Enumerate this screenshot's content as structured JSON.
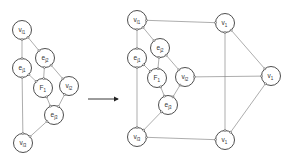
{
  "diagram": {
    "left": {
      "nodes": [
        {
          "id": "vl1",
          "main": "v",
          "sub": "l1",
          "x": 22,
          "y": 30
        },
        {
          "id": "ej2",
          "main": "e",
          "sub": "j2",
          "x": 45,
          "y": 58
        },
        {
          "id": "ej1",
          "main": "e",
          "sub": "j1",
          "x": 22,
          "y": 68
        },
        {
          "id": "F1",
          "main": "F",
          "sub": "1",
          "x": 43,
          "y": 88
        },
        {
          "id": "vl2",
          "main": "v",
          "sub": "l2",
          "x": 69,
          "y": 86
        },
        {
          "id": "ej3",
          "main": "e",
          "sub": "j3",
          "x": 54,
          "y": 115
        },
        {
          "id": "vl3",
          "main": "v",
          "sub": "l3",
          "x": 23,
          "y": 143
        }
      ],
      "edges": [
        [
          "vl1",
          "ej1"
        ],
        [
          "vl1",
          "ej2"
        ],
        [
          "ej1",
          "F1"
        ],
        [
          "ej2",
          "F1"
        ],
        [
          "ej2",
          "vl2"
        ],
        [
          "ej1",
          "vl3"
        ],
        [
          "F1",
          "ej3"
        ],
        [
          "vl2",
          "ej3"
        ],
        [
          "ej3",
          "vl3"
        ]
      ]
    },
    "arrow": {
      "x1": 88,
      "y1": 99,
      "x2": 118,
      "y2": 99
    },
    "right": {
      "nodes": [
        {
          "id": "vl1",
          "main": "v",
          "sub": "l1",
          "x": 137,
          "y": 20
        },
        {
          "id": "ej2",
          "main": "e",
          "sub": "j2",
          "x": 160,
          "y": 48
        },
        {
          "id": "ej1",
          "main": "e",
          "sub": "j1",
          "x": 137,
          "y": 58
        },
        {
          "id": "F1",
          "main": "F",
          "sub": "1",
          "x": 157,
          "y": 78
        },
        {
          "id": "vl2",
          "main": "v",
          "sub": "l2",
          "x": 185,
          "y": 77
        },
        {
          "id": "ej3",
          "main": "e",
          "sub": "j3",
          "x": 168,
          "y": 105
        },
        {
          "id": "vl3",
          "main": "v",
          "sub": "l3",
          "x": 137,
          "y": 137
        },
        {
          "id": "v1top",
          "main": "v",
          "sub": "1",
          "x": 225,
          "y": 23
        },
        {
          "id": "v1right",
          "main": "v",
          "sub": "1",
          "x": 271,
          "y": 76
        },
        {
          "id": "v1bottom",
          "main": "v",
          "sub": "1",
          "x": 225,
          "y": 140
        }
      ],
      "edges": [
        [
          "vl1",
          "ej1"
        ],
        [
          "vl1",
          "ej2"
        ],
        [
          "ej1",
          "F1"
        ],
        [
          "ej2",
          "F1"
        ],
        [
          "ej2",
          "vl2"
        ],
        [
          "ej1",
          "vl3"
        ],
        [
          "F1",
          "ej3"
        ],
        [
          "vl2",
          "ej3"
        ],
        [
          "ej3",
          "vl3"
        ],
        [
          "vl1",
          "v1top"
        ],
        [
          "vl2",
          "v1right"
        ],
        [
          "vl3",
          "v1bottom"
        ],
        [
          "v1top",
          "v1bottom"
        ],
        [
          "v1top",
          "v1right"
        ],
        [
          "v1right",
          "v1bottom"
        ]
      ]
    },
    "node_radius": 9.5
  }
}
